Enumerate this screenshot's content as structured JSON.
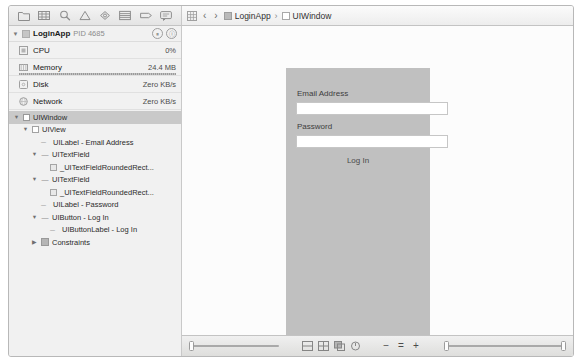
{
  "window": {
    "title": "Xcode View Debugger"
  },
  "navigator_toolbar": {
    "icons": [
      {
        "name": "project-navigator-icon",
        "glyph": "folder"
      },
      {
        "name": "source-control-navigator-icon",
        "glyph": "branch"
      },
      {
        "name": "symbol-navigator-icon",
        "glyph": "search"
      },
      {
        "name": "issue-navigator-icon",
        "glyph": "warning"
      },
      {
        "name": "test-navigator-icon",
        "glyph": "target"
      },
      {
        "name": "debug-navigator-icon",
        "glyph": "list"
      },
      {
        "name": "breakpoint-navigator-icon",
        "glyph": "tag"
      },
      {
        "name": "report-navigator-icon",
        "glyph": "bubble"
      }
    ]
  },
  "breadcrumb": {
    "jump_bar_icon": "grid-icon",
    "back_label": "‹",
    "forward_label": "›",
    "separator": "›",
    "items": [
      {
        "label": "LoginApp",
        "icon": "app-icon"
      },
      {
        "label": "UIWindow",
        "icon": "window-icon"
      }
    ]
  },
  "debug_gauges": {
    "process_name": "LoginApp",
    "process_pid": "PID 4685",
    "buttons": [
      {
        "name": "pause-gauge-button",
        "glyph": "⏸"
      },
      {
        "name": "info-gauge-button",
        "glyph": "ⓘ"
      }
    ],
    "rows": [
      {
        "label": "CPU",
        "value": "0%",
        "icon": "cpu-icon",
        "bar": false
      },
      {
        "label": "Memory",
        "value": "24.4 MB",
        "icon": "memory-icon",
        "bar": true
      },
      {
        "label": "Disk",
        "value": "Zero KB/s",
        "icon": "disk-icon",
        "bar": false
      },
      {
        "label": "Network",
        "value": "Zero KB/s",
        "icon": "network-icon",
        "bar": false
      }
    ]
  },
  "view_tree": {
    "nodes": [
      {
        "label": "UIWindow",
        "indent": 0,
        "twisty": "▼",
        "icon": "window",
        "selected": true
      },
      {
        "label": "UIView",
        "indent": 1,
        "twisty": "▼",
        "icon": "view",
        "selected": false
      },
      {
        "label": "UILabel - Email Address",
        "indent": 2,
        "twisty": "",
        "icon": "label",
        "selected": false
      },
      {
        "label": "UITextField",
        "indent": 2,
        "twisty": "▼",
        "icon": "textfield",
        "selected": false
      },
      {
        "label": "_UITextFieldRoundedRect...",
        "indent": 3,
        "twisty": "",
        "icon": "rect",
        "selected": false
      },
      {
        "label": "UITextField",
        "indent": 2,
        "twisty": "▼",
        "icon": "textfield",
        "selected": false
      },
      {
        "label": "_UITextFieldRoundedRect...",
        "indent": 3,
        "twisty": "",
        "icon": "rect",
        "selected": false
      },
      {
        "label": "UILabel - Password",
        "indent": 2,
        "twisty": "",
        "icon": "label",
        "selected": false
      },
      {
        "label": "UIButton - Log In",
        "indent": 2,
        "twisty": "▼",
        "icon": "button",
        "selected": false
      },
      {
        "label": "UIButtonLabel - Log In",
        "indent": 3,
        "twisty": "",
        "icon": "label",
        "selected": false
      },
      {
        "label": "Constraints",
        "indent": 2,
        "twisty": "▶",
        "icon": "constraints",
        "selected": false
      }
    ]
  },
  "canvas": {
    "email_label": "Email Address",
    "password_label": "Password",
    "login_button": "Log In"
  },
  "bottom_bar": {
    "view_buttons": [
      {
        "name": "collapse-depth-button",
        "glyph": "⊟"
      },
      {
        "name": "expand-depth-button",
        "glyph": "⊞"
      },
      {
        "name": "clipped-content-button",
        "glyph": "⬚"
      },
      {
        "name": "orientation-button",
        "glyph": "◴"
      }
    ],
    "zoom_out_label": "−",
    "zoom_actual_label": "=",
    "zoom_in_label": "+"
  },
  "colors": {
    "uiwindow_gray": "#c0c0c0",
    "chrome": "#efefef",
    "selection": "#c9c9c9"
  }
}
